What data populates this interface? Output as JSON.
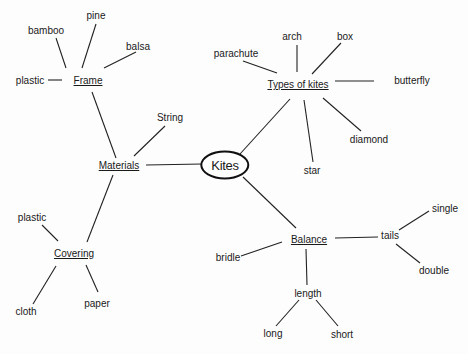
{
  "diagram": {
    "type": "concept-map",
    "root": {
      "id": "kites",
      "label": "Kites",
      "x": 225,
      "y": 165
    },
    "nodes": [
      {
        "id": "materials",
        "label": "Materials",
        "x": 119,
        "y": 166,
        "style": "hub"
      },
      {
        "id": "types",
        "label": "Types of kites",
        "x": 298,
        "y": 85,
        "style": "hub"
      },
      {
        "id": "balance",
        "label": "Balance",
        "x": 309,
        "y": 240,
        "style": "hub"
      },
      {
        "id": "frame",
        "label": "Frame",
        "x": 88,
        "y": 81,
        "style": "hub"
      },
      {
        "id": "covering",
        "label": "Covering",
        "x": 74,
        "y": 254,
        "style": "hub"
      },
      {
        "id": "string",
        "label": "String",
        "x": 170,
        "y": 118,
        "style": "leaf"
      },
      {
        "id": "frame-bamboo",
        "label": "bamboo",
        "x": 46,
        "y": 31,
        "style": "leaf"
      },
      {
        "id": "frame-pine",
        "label": "pine",
        "x": 96,
        "y": 16,
        "style": "leaf"
      },
      {
        "id": "frame-balsa",
        "label": "balsa",
        "x": 138,
        "y": 47,
        "style": "leaf"
      },
      {
        "id": "frame-plastic",
        "label": "plastic",
        "x": 30,
        "y": 81,
        "style": "leaf"
      },
      {
        "id": "cover-plastic",
        "label": "plastic",
        "x": 32,
        "y": 218,
        "style": "leaf"
      },
      {
        "id": "cover-cloth",
        "label": "cloth",
        "x": 26,
        "y": 312,
        "style": "leaf"
      },
      {
        "id": "cover-paper",
        "label": "paper",
        "x": 97,
        "y": 304,
        "style": "leaf"
      },
      {
        "id": "type-parachute",
        "label": "parachute",
        "x": 236,
        "y": 54,
        "style": "leaf"
      },
      {
        "id": "type-arch",
        "label": "arch",
        "x": 292,
        "y": 37,
        "style": "leaf"
      },
      {
        "id": "type-box",
        "label": "box",
        "x": 345,
        "y": 37,
        "style": "leaf"
      },
      {
        "id": "type-butterfly",
        "label": "butterfly",
        "x": 412,
        "y": 81,
        "style": "leaf"
      },
      {
        "id": "type-diamond",
        "label": "diamond",
        "x": 369,
        "y": 140,
        "style": "leaf"
      },
      {
        "id": "type-star",
        "label": "star",
        "x": 312,
        "y": 171,
        "style": "leaf"
      },
      {
        "id": "bal-bridle",
        "label": "bridle",
        "x": 228,
        "y": 258,
        "style": "leaf"
      },
      {
        "id": "bal-tails",
        "label": "tails",
        "x": 390,
        "y": 236,
        "style": "leaf"
      },
      {
        "id": "tails-single",
        "label": "single",
        "x": 445,
        "y": 209,
        "style": "leaf"
      },
      {
        "id": "tails-double",
        "label": "double",
        "x": 434,
        "y": 271,
        "style": "leaf"
      },
      {
        "id": "bal-length",
        "label": "length",
        "x": 308,
        "y": 294,
        "style": "leaf"
      },
      {
        "id": "len-long",
        "label": "long",
        "x": 273,
        "y": 334,
        "style": "leaf"
      },
      {
        "id": "len-short",
        "label": "short",
        "x": 342,
        "y": 335,
        "style": "leaf"
      }
    ],
    "edges": [
      {
        "from": "kites",
        "to": "materials",
        "x1": 202,
        "y1": 164,
        "x2": 146,
        "y2": 165
      },
      {
        "from": "kites",
        "to": "types",
        "x1": 240,
        "y1": 154,
        "x2": 290,
        "y2": 99
      },
      {
        "from": "kites",
        "to": "balance",
        "x1": 243,
        "y1": 177,
        "x2": 296,
        "y2": 228
      },
      {
        "from": "materials",
        "to": "frame",
        "x1": 116,
        "y1": 158,
        "x2": 92,
        "y2": 92
      },
      {
        "from": "materials",
        "to": "string",
        "x1": 134,
        "y1": 156,
        "x2": 165,
        "y2": 126
      },
      {
        "from": "materials",
        "to": "covering",
        "x1": 113,
        "y1": 175,
        "x2": 87,
        "y2": 242
      },
      {
        "from": "frame",
        "to": "frame-bamboo",
        "x1": 66,
        "y1": 68,
        "x2": 56,
        "y2": 38
      },
      {
        "from": "frame",
        "to": "frame-pine",
        "x1": 82,
        "y1": 68,
        "x2": 96,
        "y2": 24
      },
      {
        "from": "frame",
        "to": "frame-balsa",
        "x1": 104,
        "y1": 68,
        "x2": 136,
        "y2": 52
      },
      {
        "from": "frame",
        "to": "frame-plastic",
        "x1": 48,
        "y1": 80,
        "x2": 62,
        "y2": 80
      },
      {
        "from": "covering",
        "to": "cover-plastic",
        "x1": 42,
        "y1": 225,
        "x2": 58,
        "y2": 241
      },
      {
        "from": "covering",
        "to": "cover-cloth",
        "x1": 33,
        "y1": 304,
        "x2": 56,
        "y2": 266
      },
      {
        "from": "covering",
        "to": "cover-paper",
        "x1": 86,
        "y1": 265,
        "x2": 98,
        "y2": 292
      },
      {
        "from": "types",
        "to": "type-parachute",
        "x1": 243,
        "y1": 61,
        "x2": 277,
        "y2": 73
      },
      {
        "from": "types",
        "to": "type-arch",
        "x1": 297,
        "y1": 45,
        "x2": 297,
        "y2": 72
      },
      {
        "from": "types",
        "to": "type-box",
        "x1": 341,
        "y1": 43,
        "x2": 312,
        "y2": 74
      },
      {
        "from": "types",
        "to": "type-butterfly",
        "x1": 335,
        "y1": 81,
        "x2": 374,
        "y2": 81
      },
      {
        "from": "types",
        "to": "type-diamond",
        "x1": 323,
        "y1": 98,
        "x2": 361,
        "y2": 131
      },
      {
        "from": "types",
        "to": "type-star",
        "x1": 304,
        "y1": 100,
        "x2": 313,
        "y2": 162
      },
      {
        "from": "balance",
        "to": "bal-bridle",
        "x1": 241,
        "y1": 256,
        "x2": 282,
        "y2": 242
      },
      {
        "from": "balance",
        "to": "bal-tails",
        "x1": 335,
        "y1": 238,
        "x2": 378,
        "y2": 237
      },
      {
        "from": "balance",
        "to": "bal-length",
        "x1": 306,
        "y1": 249,
        "x2": 307,
        "y2": 285
      },
      {
        "from": "bal-tails",
        "to": "tails-single",
        "x1": 399,
        "y1": 230,
        "x2": 429,
        "y2": 211
      },
      {
        "from": "bal-tails",
        "to": "tails-double",
        "x1": 396,
        "y1": 244,
        "x2": 420,
        "y2": 263
      },
      {
        "from": "bal-length",
        "to": "len-long",
        "x1": 299,
        "y1": 300,
        "x2": 276,
        "y2": 326
      },
      {
        "from": "bal-length",
        "to": "len-short",
        "x1": 316,
        "y1": 300,
        "x2": 338,
        "y2": 326
      }
    ]
  },
  "labels": {
    "kites": "Kites",
    "materials": "Materials",
    "types": "Types of kites",
    "balance": "Balance",
    "frame": "Frame",
    "covering": "Covering",
    "string": "String",
    "frame_bamboo": "bamboo",
    "frame_pine": "pine",
    "frame_balsa": "balsa",
    "frame_plastic": "plastic",
    "cover_plastic": "plastic",
    "cover_cloth": "cloth",
    "cover_paper": "paper",
    "type_parachute": "parachute",
    "type_arch": "arch",
    "type_box": "box",
    "type_butterfly": "butterfly",
    "type_diamond": "diamond",
    "type_star": "star",
    "bal_bridle": "bridle",
    "bal_tails": "tails",
    "tails_single": "single",
    "tails_double": "double",
    "bal_length": "length",
    "len_long": "long",
    "len_short": "short"
  },
  "colors": {
    "background": "#fdfdfd",
    "ink": "#1a1a1a",
    "line": "#222222"
  }
}
